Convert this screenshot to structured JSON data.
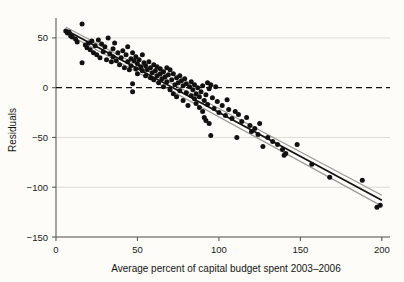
{
  "chart_data": {
    "type": "scatter",
    "title": "",
    "xlabel": "Average percent of capital budget spent 2003–2006",
    "ylabel": "Residuals",
    "xlim": [
      0,
      205
    ],
    "ylim": [
      -150,
      70
    ],
    "xticks": [
      0,
      50,
      100,
      150,
      200
    ],
    "xticklabels": [
      "0",
      "50",
      "100",
      "150",
      "200"
    ],
    "yticks": [
      50,
      0,
      -50,
      -100,
      -150
    ],
    "yticklabels": [
      "50",
      "0",
      "−50",
      "−100",
      "−150"
    ],
    "grid": "horizontal",
    "legend": "none",
    "colors": {
      "background": "#fdfcf9",
      "point": "#12110f",
      "fit_line": "#12110f",
      "band_line": "#9a9a95",
      "gridline": "#d9d8d2",
      "axis": "#5c5c57",
      "zero_line": "#12110f",
      "text": "#141412"
    },
    "reference_line": {
      "y": 0,
      "style": "dashed",
      "label": "zero residual line"
    },
    "fit_line": {
      "name": "linear fit",
      "x": [
        6,
        200
      ],
      "y": [
        58,
        -113
      ],
      "style": "solid",
      "band": {
        "name": "confidence band",
        "upper_y": [
          61,
          -108
        ],
        "lower_y": [
          55,
          -119
        ]
      }
    },
    "series": [
      {
        "name": "Residuals vs average percent of capital budget spent",
        "marker": "filled-circle",
        "n_points": 152,
        "points": [
          [
            6,
            57
          ],
          [
            7,
            55
          ],
          [
            8,
            56
          ],
          [
            9,
            52
          ],
          [
            10,
            51
          ],
          [
            12,
            49
          ],
          [
            13,
            46
          ],
          [
            16,
            64
          ],
          [
            16,
            25
          ],
          [
            18,
            43
          ],
          [
            19,
            40
          ],
          [
            20,
            45
          ],
          [
            21,
            38
          ],
          [
            22,
            47
          ],
          [
            23,
            35
          ],
          [
            24,
            42
          ],
          [
            25,
            33
          ],
          [
            26,
            48
          ],
          [
            27,
            30
          ],
          [
            28,
            44
          ],
          [
            29,
            36
          ],
          [
            30,
            41
          ],
          [
            31,
            28
          ],
          [
            32,
            50
          ],
          [
            33,
            34
          ],
          [
            34,
            26
          ],
          [
            35,
            39
          ],
          [
            35,
            31
          ],
          [
            36,
            45
          ],
          [
            37,
            27
          ],
          [
            38,
            35
          ],
          [
            39,
            23
          ],
          [
            40,
            30
          ],
          [
            41,
            37
          ],
          [
            42,
            20
          ],
          [
            43,
            33
          ],
          [
            44,
            26
          ],
          [
            44,
            41
          ],
          [
            45,
            18
          ],
          [
            46,
            29
          ],
          [
            46,
            22
          ],
          [
            47,
            35
          ],
          [
            47,
            4
          ],
          [
            47,
            -4
          ],
          [
            48,
            27
          ],
          [
            49,
            19
          ],
          [
            49,
            31
          ],
          [
            50,
            24
          ],
          [
            50,
            14
          ],
          [
            51,
            28
          ],
          [
            52,
            21
          ],
          [
            53,
            33
          ],
          [
            53,
            17
          ],
          [
            54,
            25
          ],
          [
            55,
            12
          ],
          [
            55,
            22
          ],
          [
            56,
            18
          ],
          [
            57,
            26
          ],
          [
            58,
            10
          ],
          [
            58,
            20
          ],
          [
            59,
            15
          ],
          [
            60,
            23
          ],
          [
            60,
            8
          ],
          [
            61,
            17
          ],
          [
            62,
            12
          ],
          [
            62,
            21
          ],
          [
            63,
            5
          ],
          [
            64,
            14
          ],
          [
            64,
            19
          ],
          [
            65,
            9
          ],
          [
            66,
            16
          ],
          [
            66,
            1
          ],
          [
            67,
            11
          ],
          [
            68,
            20
          ],
          [
            68,
            6
          ],
          [
            69,
            13
          ],
          [
            70,
            -2
          ],
          [
            70,
            18
          ],
          [
            71,
            8
          ],
          [
            72,
            14
          ],
          [
            72,
            -6
          ],
          [
            73,
            3
          ],
          [
            74,
            10
          ],
          [
            74,
            -9
          ],
          [
            75,
            5
          ],
          [
            76,
            12
          ],
          [
            76,
            -3
          ],
          [
            77,
            7
          ],
          [
            78,
            -13
          ],
          [
            78,
            2
          ],
          [
            79,
            9
          ],
          [
            80,
            -5
          ],
          [
            80,
            4
          ],
          [
            81,
            -18
          ],
          [
            82,
            1
          ],
          [
            83,
            -8
          ],
          [
            83,
            6
          ],
          [
            84,
            -2
          ],
          [
            85,
            -11
          ],
          [
            85,
            3
          ],
          [
            86,
            -16
          ],
          [
            86,
            -6
          ],
          [
            87,
            0
          ],
          [
            88,
            -20
          ],
          [
            88,
            -9
          ],
          [
            89,
            -4
          ],
          [
            90,
            -24
          ],
          [
            90,
            2
          ],
          [
            91,
            -13
          ],
          [
            91,
            -30
          ],
          [
            92,
            -7
          ],
          [
            92,
            -33
          ],
          [
            93,
            5
          ],
          [
            93,
            -17
          ],
          [
            94,
            -1
          ],
          [
            94,
            -36
          ],
          [
            95,
            3
          ],
          [
            95,
            -48
          ],
          [
            96,
            -10
          ],
          [
            97,
            -21
          ],
          [
            98,
            1
          ],
          [
            99,
            -14
          ],
          [
            100,
            -25
          ],
          [
            102,
            -18
          ],
          [
            104,
            -28
          ],
          [
            105,
            -12
          ],
          [
            106,
            -22
          ],
          [
            108,
            -31
          ],
          [
            110,
            -24
          ],
          [
            111,
            -50
          ],
          [
            112,
            -27
          ],
          [
            114,
            -34
          ],
          [
            117,
            -30
          ],
          [
            119,
            -38
          ],
          [
            120,
            -44
          ],
          [
            122,
            -41
          ],
          [
            124,
            -47
          ],
          [
            125,
            -36
          ],
          [
            127,
            -59
          ],
          [
            130,
            -50
          ],
          [
            133,
            -54
          ],
          [
            136,
            -57
          ],
          [
            139,
            -62
          ],
          [
            140,
            -68
          ],
          [
            141,
            -66
          ],
          [
            148,
            -57
          ],
          [
            157,
            -77
          ],
          [
            168,
            -90
          ],
          [
            188,
            -93
          ],
          [
            197,
            -120
          ],
          [
            199,
            -118
          ]
        ]
      }
    ]
  },
  "axes": {
    "x_axis_name": "x-axis",
    "y_axis_name": "y-axis"
  }
}
